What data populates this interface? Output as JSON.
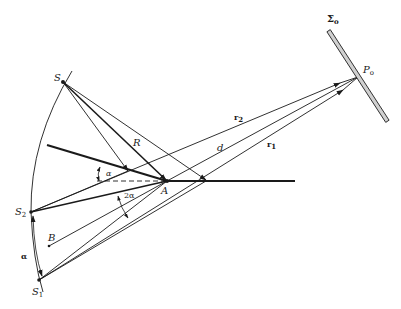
{
  "figure": {
    "labels": {
      "S": "S",
      "S1": "S",
      "S1_sub": "1",
      "S2": "S",
      "S2_sub": "2",
      "A": "A",
      "B": "B",
      "R": "R",
      "d": "d",
      "r1": "r",
      "r1_sub": "1",
      "r2": "r",
      "r2_sub": "2",
      "P0": "P",
      "P0_sub": "o",
      "Sigma0": "Σ",
      "Sigma0_sub": "o",
      "alpha_top": "α",
      "two_alpha": "2α",
      "alpha_arc": "α"
    },
    "colors": {
      "ink": "#1a1a1a",
      "screen_fill": "#d0d0d0"
    }
  }
}
